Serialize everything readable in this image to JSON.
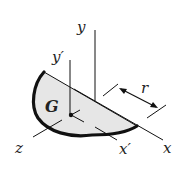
{
  "diagram": {
    "labels": {
      "y_axis": "y",
      "y_prime_axis": "y′",
      "x_axis": "x",
      "x_prime_axis": "x′",
      "z_axis": "z",
      "centroid": "G",
      "radius": "r"
    },
    "colors": {
      "line": "#111111",
      "plate_fill": "#e6e6e6",
      "rim": "#111111",
      "background": "#ffffff"
    }
  }
}
